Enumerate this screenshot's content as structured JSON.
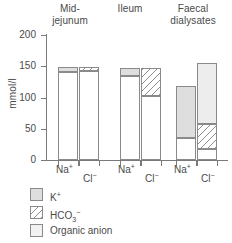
{
  "chart_data": {
    "type": "bar",
    "title": "",
    "xlabel": "",
    "ylabel": "mmol/l",
    "ylim": [
      0,
      200
    ],
    "yticks": [
      0,
      50,
      100,
      150,
      200
    ],
    "grid": false,
    "legend_position": "below-left",
    "groups": [
      "Mid-jejunum",
      "Ileum",
      "Faecal dialysates"
    ],
    "categories": [
      "Na+",
      "Cl-"
    ],
    "stack_components": [
      "Organic anion",
      "HCO3-",
      "K+"
    ],
    "bars": [
      {
        "group": "Mid-jejunum",
        "ion": "Na+",
        "total": 149,
        "segments": [
          {
            "name": "base",
            "from": 0,
            "to": 141,
            "value": 141
          },
          {
            "name": "K+",
            "from": 141,
            "to": 149,
            "value": 8
          }
        ]
      },
      {
        "group": "Mid-jejunum",
        "ion": "Cl-",
        "total": 149,
        "segments": [
          {
            "name": "base",
            "from": 0,
            "to": 143,
            "value": 143
          },
          {
            "name": "HCO3-",
            "from": 143,
            "to": 149,
            "value": 6
          }
        ]
      },
      {
        "group": "Ileum",
        "ion": "Na+",
        "total": 148,
        "segments": [
          {
            "name": "base",
            "from": 0,
            "to": 135,
            "value": 135
          },
          {
            "name": "K+",
            "from": 135,
            "to": 148,
            "value": 13
          }
        ]
      },
      {
        "group": "Ileum",
        "ion": "Cl-",
        "total": 148,
        "segments": [
          {
            "name": "base",
            "from": 0,
            "to": 102,
            "value": 102
          },
          {
            "name": "HCO3-",
            "from": 102,
            "to": 148,
            "value": 46
          }
        ]
      },
      {
        "group": "Faecal dialysates",
        "ion": "Na+",
        "total": 118,
        "segments": [
          {
            "name": "base",
            "from": 0,
            "to": 35,
            "value": 35
          },
          {
            "name": "K+",
            "from": 35,
            "to": 118,
            "value": 83
          }
        ]
      },
      {
        "group": "Faecal dialysates",
        "ion": "Cl-",
        "total": 155,
        "segments": [
          {
            "name": "base",
            "from": 0,
            "to": 18,
            "value": 18
          },
          {
            "name": "HCO3-",
            "from": 18,
            "to": 57,
            "value": 39
          },
          {
            "name": "Organic anion",
            "from": 57,
            "to": 155,
            "value": 98
          }
        ]
      }
    ]
  },
  "headings": [
    {
      "line1": "Mid-",
      "line2": "jejunum"
    },
    {
      "line1": "Ileum",
      "line2": ""
    },
    {
      "line1": "Faecal",
      "line2": "dialysates"
    }
  ],
  "axis": {
    "y_label": "mmol/l",
    "y_ticks": [
      "200",
      "150",
      "100",
      "50",
      "0"
    ]
  },
  "ion_labels": [
    {
      "base": "Na",
      "sup": "+"
    },
    {
      "base": "Cl",
      "sup": "−"
    },
    {
      "base": "Na",
      "sup": "+"
    },
    {
      "base": "Cl",
      "sup": "−"
    },
    {
      "base": "Na",
      "sup": "+"
    },
    {
      "base": "Cl",
      "sup": "−"
    }
  ],
  "legend": [
    {
      "label_base": "K",
      "label_sup": "+",
      "label_sub": "",
      "swatch": "k"
    },
    {
      "label_base": "HCO",
      "label_sup": "−",
      "label_sub": "3",
      "swatch": "hco3"
    },
    {
      "label_base": "Organic anion",
      "label_sup": "",
      "label_sub": "",
      "swatch": "org"
    }
  ],
  "colors": {
    "k_fill": "#dedede",
    "organic_fill": "#ededed",
    "hatch_stroke": "#8f8f8f",
    "outline": "#8a8a8a",
    "axis": "#7a7a7a",
    "text": "#4a4a4a"
  }
}
